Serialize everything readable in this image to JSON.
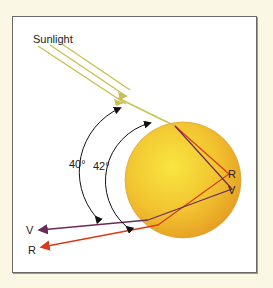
{
  "diagram": {
    "title_label": "Sunlight",
    "angles": {
      "violet": "40°",
      "red": "42°"
    },
    "labels": {
      "red_inner": "R",
      "violet_inner": "V",
      "violet_out": "V",
      "red_out": "R"
    },
    "colors": {
      "background": "#faf7e4",
      "sunlight": "#c8c050",
      "droplet_center": "#f7e040",
      "droplet_edge": "#e8a020",
      "red_ray": "#d83a1a",
      "violet_ray": "#6a2a5a",
      "arc": "#111111"
    }
  }
}
